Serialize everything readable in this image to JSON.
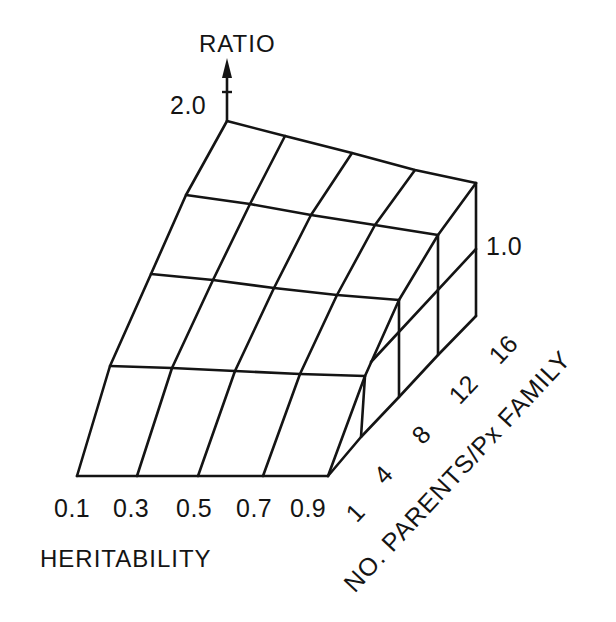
{
  "chart_data": {
    "type": "surface-3d-wireframe",
    "title": "",
    "z_axis": {
      "label": "RATIO",
      "ticks": [
        "2.0",
        "1.0"
      ]
    },
    "x_axis": {
      "label": "HERITABILITY",
      "ticks": [
        "0.1",
        "0.3",
        "0.5",
        "0.7",
        "0.9"
      ]
    },
    "y_axis": {
      "label": "NO. PARENTS/Px FAMILY",
      "ticks": [
        "1",
        "4",
        "8",
        "12",
        "16"
      ]
    },
    "x_values": [
      0.1,
      0.3,
      0.5,
      0.7,
      0.9
    ],
    "y_values": [
      1,
      4,
      8,
      12,
      16
    ],
    "ratio_surface_approx": {
      "description": "Ratio decreases as heritability increases and as number of parents per Px family decreases; max 2.0 at h=0.1, 16 parents; approaches ~1.0 near h=0.9",
      "rows_by_parents": [
        {
          "parents": 16,
          "values": [
            2.0,
            1.85,
            1.7,
            1.55,
            1.4
          ]
        },
        {
          "parents": 12,
          "values": [
            1.75,
            1.6,
            1.45,
            1.3,
            1.2
          ]
        },
        {
          "parents": 8,
          "values": [
            1.5,
            1.4,
            1.3,
            1.2,
            1.1
          ]
        },
        {
          "parents": 4,
          "values": [
            1.25,
            1.2,
            1.15,
            1.1,
            1.05
          ]
        },
        {
          "parents": 1,
          "values": [
            1.0,
            1.0,
            1.0,
            1.0,
            1.0
          ]
        }
      ]
    },
    "grid": false,
    "legend": null
  },
  "labels": {
    "ratio": "RATIO",
    "ratio_top": "2.0",
    "ratio_mid": "1.0",
    "heritability": "HERITABILITY",
    "h_ticks": [
      "0.1",
      "0.3",
      "0.5",
      "0.7",
      "0.9"
    ],
    "parents_ticks": [
      "1",
      "4",
      "8",
      "12",
      "16"
    ],
    "parents_title": "NO. PARENTS/Px FAMILY"
  },
  "geometry": {
    "surface_rows": [
      [
        [
          227,
          121
        ],
        [
          285,
          136
        ],
        [
          352,
          153
        ],
        [
          415,
          170
        ],
        [
          476,
          183
        ]
      ],
      [
        [
          186,
          195
        ],
        [
          250,
          204
        ],
        [
          311,
          215
        ],
        [
          375,
          225
        ],
        [
          438,
          235
        ]
      ],
      [
        [
          151,
          274
        ],
        [
          213,
          280
        ],
        [
          274,
          288
        ],
        [
          337,
          295
        ],
        [
          399,
          300
        ]
      ],
      [
        [
          110,
          366
        ],
        [
          172,
          368
        ],
        [
          235,
          371
        ],
        [
          300,
          374
        ],
        [
          365,
          376
        ]
      ],
      [
        [
          77,
          476
        ],
        [
          137,
          476
        ],
        [
          198,
          476
        ],
        [
          263,
          476
        ],
        [
          328,
          476
        ]
      ]
    ],
    "side_base": [
      [
        328,
        476
      ],
      [
        361,
        437
      ],
      [
        399,
        397
      ],
      [
        438,
        355
      ],
      [
        476,
        316
      ]
    ],
    "side_ratio1": [
      [
        371,
        362
      ],
      [
        476,
        249
      ]
    ],
    "axis_arrow": {
      "x": 227,
      "y_top": 58,
      "y_bottom": 121
    }
  }
}
